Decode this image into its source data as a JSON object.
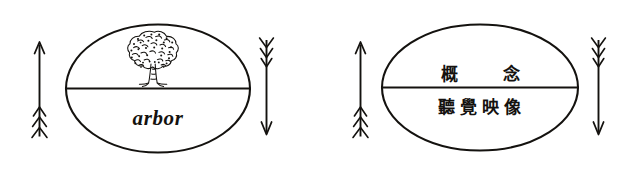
{
  "figure": {
    "background_color": "#ffffff",
    "ink_color": "#14120f",
    "width": 626,
    "height": 172
  },
  "panels": [
    {
      "id": "latin-panel",
      "upper_content_type": "tree-drawing",
      "upper_icon_name": "tree-drawing",
      "lower_label": "arbor",
      "left_arrow": {
        "name": "up-arrow",
        "direction": "up",
        "fletched_end": "bottom"
      },
      "right_arrow": {
        "name": "down-arrow",
        "direction": "down",
        "fletched_end": "top"
      }
    },
    {
      "id": "japanese-panel",
      "upper_label": "概　念",
      "lower_label": "聽覺映像",
      "left_arrow": {
        "name": "up-arrow",
        "direction": "up",
        "fletched_end": "bottom"
      },
      "right_arrow": {
        "name": "down-arrow",
        "direction": "down",
        "fletched_end": "top"
      }
    }
  ]
}
